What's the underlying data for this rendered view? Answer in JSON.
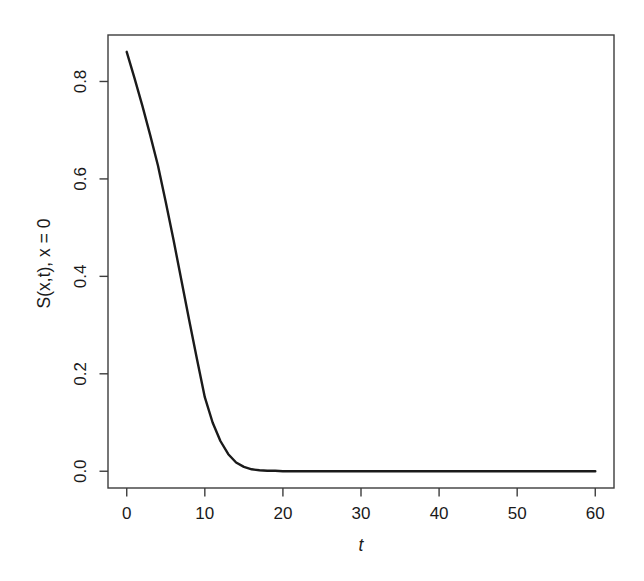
{
  "figure": {
    "background": "#ffffff"
  },
  "chart_data": {
    "type": "line",
    "title": "",
    "xlabel": "t",
    "ylabel": "S(x,t), x = 0",
    "x_ticks": [
      "0",
      "10",
      "20",
      "30",
      "40",
      "50",
      "60"
    ],
    "x_tick_values": [
      0,
      10,
      20,
      30,
      40,
      50,
      60
    ],
    "y_ticks": [
      "0.0",
      "0.2",
      "0.4",
      "0.6",
      "0.8"
    ],
    "y_tick_values": [
      0,
      0.2,
      0.4,
      0.6,
      0.8
    ],
    "xlim": [
      -2.4,
      62.4
    ],
    "ylim": [
      -0.0344,
      0.8954
    ],
    "x_range_data": [
      0,
      60
    ],
    "y_range_data": [
      0,
      0.861
    ],
    "grid": false,
    "legend": null,
    "line_color": "#1a1a1a",
    "axis_color": "#3d3d3d",
    "series": [
      {
        "name": "S(x,t), x = 0",
        "x": [
          0,
          1,
          2,
          3,
          4,
          5,
          6,
          7,
          8,
          9,
          10,
          11,
          12,
          13,
          14,
          15,
          16,
          17,
          18,
          19,
          20,
          22,
          24,
          26,
          28,
          30,
          35,
          40,
          45,
          50,
          55,
          60
        ],
        "y": [
          0.861,
          0.807,
          0.75,
          0.69,
          0.627,
          0.552,
          0.474,
          0.392,
          0.31,
          0.23,
          0.152,
          0.1,
          0.062,
          0.035,
          0.018,
          0.009,
          0.004,
          0.002,
          0.001,
          0.001,
          0.0,
          0.0,
          0.0,
          0.0,
          0.0,
          0.0,
          0.0,
          0.0,
          0.0,
          0.0,
          0.0,
          0.0
        ]
      }
    ]
  }
}
